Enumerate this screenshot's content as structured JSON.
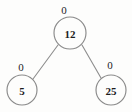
{
  "figure": {
    "type": "binary-tree-diagram",
    "title": "",
    "background_color": "#fdfdfc",
    "node_stroke_color": "#8a8a8a",
    "edge_color": "#8d8d8d",
    "text_color": "#1c1c1c"
  },
  "nodes": [
    {
      "id": "root",
      "key": "12",
      "balance_factor": "0",
      "cx": 70,
      "cy": 33,
      "r": 16,
      "bf_x": 64,
      "bf_y": 10
    },
    {
      "id": "left-child",
      "key": "5",
      "balance_factor": "0",
      "cx": 22,
      "cy": 90,
      "r": 15,
      "bf_x": 21,
      "bf_y": 67
    },
    {
      "id": "right-child",
      "key": "25",
      "balance_factor": "0",
      "cx": 111,
      "cy": 90,
      "r": 15,
      "bf_x": 110,
      "bf_y": 65
    }
  ],
  "edges": [
    {
      "id": "root-to-left",
      "from": "root",
      "to": "left-child",
      "x1": 58,
      "y1": 45,
      "x2": 33,
      "y2": 79
    },
    {
      "id": "root-to-right",
      "from": "root",
      "to": "right-child",
      "x1": 82,
      "y1": 45,
      "x2": 101,
      "y2": 78
    }
  ]
}
